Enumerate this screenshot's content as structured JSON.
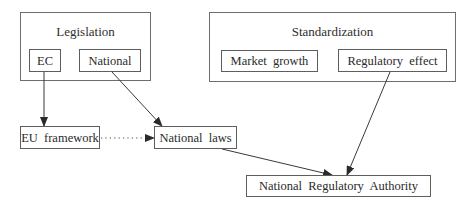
{
  "diagram": {
    "groups": {
      "legislation": {
        "title": "Legislation"
      },
      "standardization": {
        "title": "Standardization"
      }
    },
    "nodes": {
      "ec": {
        "label": "EC"
      },
      "national": {
        "label": "National"
      },
      "market_growth": {
        "label": "Market  growth"
      },
      "regulatory_effect": {
        "label": "Regulatory  effect"
      },
      "eu_framework": {
        "label": "EU  framework"
      },
      "national_laws": {
        "label": "National  laws"
      },
      "national_regulatory_authority": {
        "label": "National  Regulatory  Authority"
      }
    },
    "edges": [
      {
        "from": "EC",
        "to": "EU framework",
        "style": "solid"
      },
      {
        "from": "National",
        "to": "National laws",
        "style": "solid"
      },
      {
        "from": "EU framework",
        "to": "National laws",
        "style": "dotted"
      },
      {
        "from": "National laws",
        "to": "National Regulatory Authority",
        "style": "solid"
      },
      {
        "from": "Regulatory effect",
        "to": "National Regulatory Authority",
        "style": "solid"
      }
    ],
    "colors": {
      "line": "#3a3a3a",
      "box_border": "#5e5e5e",
      "text": "#2a2a2a"
    }
  }
}
